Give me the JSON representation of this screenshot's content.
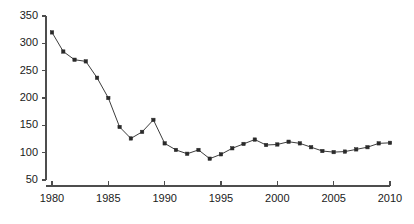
{
  "chart_data": {
    "type": "line",
    "title": "",
    "subtitle": "",
    "xlabel": "",
    "ylabel": "",
    "x": [
      1980,
      1981,
      1982,
      1983,
      1984,
      1985,
      1986,
      1987,
      1988,
      1989,
      1990,
      1991,
      1992,
      1993,
      1994,
      1995,
      1996,
      1997,
      1998,
      1999,
      2000,
      2001,
      2002,
      2003,
      2004,
      2005,
      2006,
      2007,
      2008,
      2009,
      2010
    ],
    "values": [
      320,
      285,
      270,
      267,
      237,
      200,
      147,
      126,
      138,
      160,
      117,
      105,
      98,
      105,
      89,
      97,
      108,
      116,
      124,
      114,
      115,
      120,
      117,
      110,
      103,
      101,
      102,
      106,
      110,
      117,
      118
    ],
    "series": [
      {
        "name": "series-1",
        "values": [
          320,
          285,
          270,
          267,
          237,
          200,
          147,
          126,
          138,
          160,
          117,
          105,
          98,
          105,
          89,
          97,
          108,
          116,
          124,
          114,
          115,
          120,
          117,
          110,
          103,
          101,
          102,
          106,
          110,
          117,
          118
        ]
      }
    ],
    "xlim": [
      1980,
      2010
    ],
    "ylim": [
      50,
      350
    ],
    "xticks": [
      1980,
      1985,
      1990,
      1995,
      2000,
      2005,
      2010
    ],
    "xtick_labels": [
      "1980",
      "1985",
      "1990",
      "1995",
      "2000",
      "2005",
      "2010"
    ],
    "yticks": [
      50,
      100,
      150,
      200,
      250,
      300,
      350
    ],
    "ytick_labels": [
      "50",
      "100",
      "150",
      "200",
      "250",
      "300",
      "350"
    ],
    "grid": false,
    "legend": false,
    "legend_position": "none",
    "marker": "square",
    "line_color": "#3d3d3d",
    "marker_color": "#2a2a2a",
    "axis_color": "#4d4d4d",
    "background_color": "#ffffff",
    "annotations": []
  }
}
